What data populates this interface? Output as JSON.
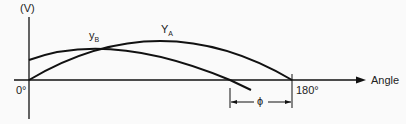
{
  "diagram": {
    "y_axis_label": "(V)",
    "x_axis_label": "Angle",
    "origin_label": "0°",
    "end_label": "180°",
    "curve_a_label": "Y",
    "curve_a_sub": "A",
    "curve_b_label": "y",
    "curve_b_sub": "B",
    "phase_label": "ϕ"
  }
}
